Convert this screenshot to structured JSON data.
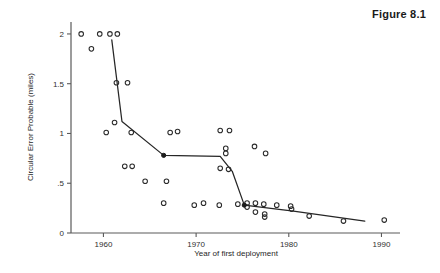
{
  "figure": {
    "title": "Figure 8.1"
  },
  "chart_data": {
    "type": "scatter",
    "title": "Figure 8.1",
    "xlabel": "Year of first deployment",
    "ylabel": "Circular Error Probable (miles)",
    "xlim": [
      1956.5,
      1992.0
    ],
    "ylim": [
      0,
      2.12
    ],
    "xticks": [
      1960,
      1970,
      1980,
      1990
    ],
    "xticklabels": [
      "1960",
      "1970",
      "1980",
      "1990"
    ],
    "yticks": [
      0,
      0.5,
      1,
      1.5,
      2
    ],
    "yticklabels": [
      "0",
      ".5",
      "1",
      "1.5",
      "2"
    ],
    "grid": false,
    "legend": null,
    "series": [
      {
        "name": "Missile systems",
        "marker": "open-circle",
        "x": [
          1957.6,
          1959.6,
          1960.7,
          1961.5,
          1958.7,
          1961.4,
          1962.6,
          1961.2,
          1960.3,
          1963.0,
          1967.2,
          1968.0,
          1962.3,
          1963.1,
          1964.5,
          1966.8,
          1966.5,
          1972.6,
          1973.6,
          1973.2,
          1973.2,
          1972.6,
          1973.5,
          1976.3,
          1977.5,
          1969.8,
          1970.8,
          1972.5,
          1974.5,
          1975.5,
          1975.5,
          1976.4,
          1976.4,
          1977.3,
          1978.7,
          1977.4,
          1977.4,
          1980.2,
          1980.3,
          1982.2,
          1985.9,
          1990.3
        ],
        "y": [
          2.0,
          2.0,
          2.0,
          2.0,
          1.85,
          1.51,
          1.51,
          1.11,
          1.01,
          1.01,
          1.01,
          1.02,
          0.67,
          0.67,
          0.52,
          0.52,
          0.3,
          1.03,
          1.03,
          0.85,
          0.8,
          0.65,
          0.64,
          0.87,
          0.8,
          0.28,
          0.3,
          0.28,
          0.29,
          0.3,
          0.26,
          0.3,
          0.21,
          0.29,
          0.28,
          0.19,
          0.16,
          0.27,
          0.24,
          0.17,
          0.12,
          0.13
        ]
      }
    ],
    "trend_line": {
      "name": "Best-of-breed frontier",
      "x": [
        1960.9,
        1962.0,
        1966.5,
        1972.6,
        1973.9,
        1975.2,
        1980.5,
        1988.2
      ],
      "y": [
        1.94,
        1.12,
        0.78,
        0.77,
        0.62,
        0.28,
        0.22,
        0.12
      ],
      "nodes": [
        {
          "x": 1966.5,
          "y": 0.78
        },
        {
          "x": 1975.2,
          "y": 0.28
        }
      ]
    }
  }
}
